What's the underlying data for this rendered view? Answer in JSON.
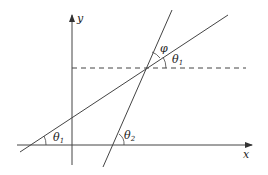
{
  "diagram": {
    "title": "",
    "axes": {
      "x_label": "x",
      "y_label": "y"
    },
    "angle_labels": {
      "theta1_bottom": {
        "symbol": "θ",
        "sub": "1"
      },
      "theta2_bottom": {
        "symbol": "θ",
        "sub": "2"
      },
      "theta1_top": {
        "symbol": "θ",
        "sub": "1"
      },
      "phi": {
        "symbol": "φ"
      }
    },
    "colors": {
      "line": "#444444",
      "background": "#ffffff"
    }
  }
}
